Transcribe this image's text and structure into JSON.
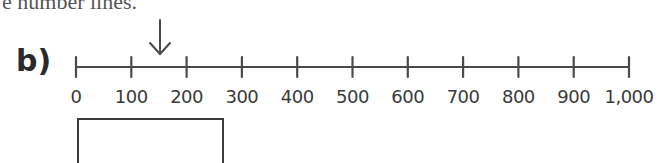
{
  "header": {
    "instruction_fragment": "e number lines."
  },
  "question": {
    "part_label": "b)",
    "number_line": {
      "start": 0,
      "end": 1000,
      "interval": 100,
      "tick_labels": [
        "0",
        "100",
        "200",
        "300",
        "400",
        "500",
        "600",
        "700",
        "800",
        "900",
        "1,000"
      ],
      "arrow": {
        "icon": "down-arrow-icon",
        "points_to_approx": 150
      }
    },
    "answer_box": {
      "value": ""
    }
  },
  "colors": {
    "line": "#4a4a4a",
    "text": "#3a3a3a",
    "background": "#ffffff"
  }
}
